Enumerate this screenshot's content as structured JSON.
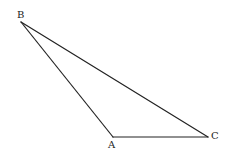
{
  "diagram": {
    "type": "triangle",
    "vertices": [
      {
        "label": "A"
      },
      {
        "label": "B"
      },
      {
        "label": "C"
      }
    ],
    "edges": [
      "AB",
      "BC",
      "CA"
    ],
    "stroke_color": "#222222",
    "background": "#ffffff"
  }
}
